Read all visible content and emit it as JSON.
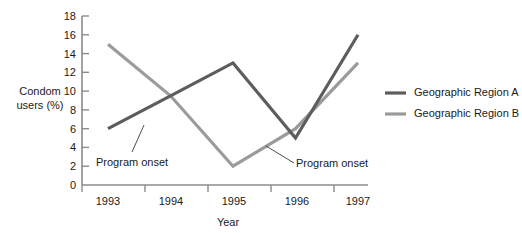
{
  "chart_data": {
    "type": "line",
    "title": "",
    "xlabel": "Year",
    "ylabel": "Condom users (%)",
    "ylabel_line1": "Condom",
    "ylabel_line2": "users (%)",
    "categories": [
      "1993",
      "1994",
      "1995",
      "1996",
      "1997"
    ],
    "x": [
      1993,
      1994,
      1995,
      1996,
      1997
    ],
    "ylim": [
      0,
      18
    ],
    "ytick_step": 2,
    "yticks": [
      "18",
      "16",
      "14",
      "12",
      "10",
      "8",
      "6",
      "4",
      "2",
      "0"
    ],
    "ytick_values": [
      18,
      16,
      14,
      12,
      10,
      8,
      6,
      4,
      2,
      0
    ],
    "grid": false,
    "legend_position": "right",
    "series": [
      {
        "name": "Geographic Region A",
        "values": [
          6,
          9.5,
          13,
          5,
          16
        ],
        "color": "#5d5d5d"
      },
      {
        "name": "Geographic Region B",
        "values": [
          15,
          9.5,
          2,
          6,
          13
        ],
        "color": "#9b9b9b"
      }
    ],
    "annotations": [
      {
        "name": "program-onset-region-a",
        "text": "Program onset",
        "text_x": 96,
        "text_y": 162,
        "leader_from_x": 132,
        "leader_from_y": 152,
        "leader_to_x": 144,
        "leader_to_y": 125
      },
      {
        "name": "program-onset-region-b",
        "text": "Program onset",
        "text_x": 297,
        "text_y": 168,
        "leader_from_x": 294,
        "leader_from_y": 164,
        "leader_to_x": 266,
        "leader_to_y": 146
      }
    ]
  },
  "legend": {
    "items": [
      {
        "label": "Geographic Region A",
        "color": "#5d5d5d"
      },
      {
        "label": "Geographic Region B",
        "color": "#9b9b9b"
      }
    ]
  },
  "colors": {
    "region_a": "#5d5d5d",
    "region_b": "#9b9b9b",
    "axis": "#8c8c8c",
    "text": "#1a1a1a",
    "background": "#ffffff"
  }
}
